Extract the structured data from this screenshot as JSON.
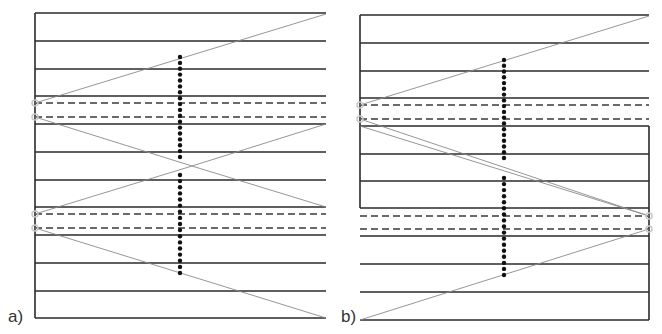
{
  "figure": {
    "colors": {
      "solid_line": "#2a2a2a",
      "dashed_line": "#3a3a3a",
      "ray": "#8a8a8a",
      "dots": "#111111",
      "endpoint_marker": "#c8c8c8"
    },
    "panels": [
      {
        "id": "a",
        "label": "a)",
        "label_pos": [
          8,
          307
        ],
        "x_left": 35,
        "x_right": 326,
        "solid_lines": [
          13,
          41,
          69,
          96,
          124,
          152,
          180,
          207,
          235,
          263,
          291,
          318
        ],
        "dashed_lines": [
          103,
          117,
          214,
          228
        ],
        "borders": [
          {
            "x": 35,
            "y1": 13,
            "y2": 318
          }
        ],
        "rays": [
          [
            35,
            103,
            326,
            14
          ],
          [
            35,
            117,
            192,
            166
          ],
          [
            192,
            166,
            326,
            124
          ],
          [
            35,
            214,
            192,
            166
          ],
          [
            192,
            166,
            326,
            207
          ],
          [
            35,
            228,
            326,
            318
          ]
        ],
        "markers": [
          [
            35,
            103
          ],
          [
            35,
            117
          ],
          [
            35,
            214
          ],
          [
            35,
            228
          ]
        ],
        "dot_columns": [
          {
            "x": 180,
            "y1": 57,
            "y2": 157,
            "n": 18
          },
          {
            "x": 180,
            "y1": 175,
            "y2": 273,
            "n": 17
          }
        ]
      },
      {
        "id": "b",
        "label": "b)",
        "label_pos": [
          341,
          307
        ],
        "x_left": 360,
        "x_right": 649,
        "solid_lines": [
          15,
          43,
          71,
          98,
          126,
          154,
          181,
          208,
          236,
          264,
          292,
          320
        ],
        "dashed_lines": [
          105,
          119,
          216,
          229
        ],
        "borders": [
          {
            "x": 360,
            "y1": 15,
            "y2": 208
          },
          {
            "x": 649,
            "y1": 126,
            "y2": 320
          }
        ],
        "rays": [
          [
            360,
            105,
            649,
            16
          ],
          [
            360,
            119,
            649,
            216
          ],
          [
            360,
            126,
            649,
            216
          ],
          [
            360,
            320,
            649,
            229
          ]
        ],
        "markers": [
          [
            360,
            105
          ],
          [
            360,
            119
          ],
          [
            649,
            216
          ],
          [
            649,
            229
          ]
        ],
        "dot_columns": [
          {
            "x": 504,
            "y1": 60,
            "y2": 158,
            "n": 18
          },
          {
            "x": 504,
            "y1": 178,
            "y2": 275,
            "n": 17
          }
        ]
      }
    ]
  }
}
